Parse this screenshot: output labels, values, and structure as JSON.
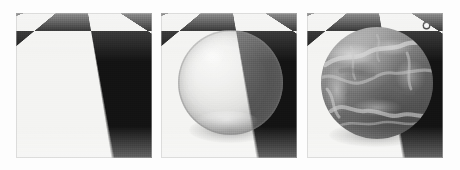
{
  "figure": {
    "background_color": "#fdfdfd",
    "panel_count": 3,
    "panel_width_px": 136,
    "panel_height_px": 145,
    "caption": ""
  },
  "panels": [
    {
      "id": "panel-1",
      "name": "checkerboard-floor",
      "label": "",
      "description": "Black and white checkerboard floor in perspective, no object",
      "x": 16,
      "y": 13,
      "width": 136,
      "height": 145,
      "floor": {
        "light_color": "#f4f4f2",
        "dark_color": "#131313",
        "tile_count_across": 12,
        "horizon_y_fraction": 0.0
      },
      "object": null
    },
    {
      "id": "panel-2",
      "name": "translucent-sphere",
      "label": "",
      "description": "Semi-transparent glass sphere resting on the checkerboard floor, checker pattern visible through it with reduced contrast",
      "x": 161,
      "y": 13,
      "width": 136,
      "height": 145,
      "floor": {
        "light_color": "#f4f4f2",
        "dark_color": "#131313",
        "tile_count_across": 12,
        "horizon_y_fraction": 0.0
      },
      "object": {
        "type": "sphere",
        "material": "translucent-glass",
        "center_x": 70,
        "center_y": 70,
        "radius": 53,
        "opacity": 0.45,
        "tint_color": "#9a9a9a",
        "highlight_color": "#ffffff"
      }
    },
    {
      "id": "panel-3",
      "name": "opaque-marble-sphere",
      "label": "",
      "description": "Opaque marble / stone textured sphere occluding the checkerboard floor, with lighter veining",
      "x": 307,
      "y": 13,
      "width": 136,
      "height": 145,
      "floor": {
        "light_color": "#f4f4f2",
        "dark_color": "#131313",
        "tile_count_across": 12,
        "horizon_y_fraction": 0.0
      },
      "object": {
        "type": "sphere",
        "material": "opaque-marble",
        "center_x": 70,
        "center_y": 70,
        "radius": 56,
        "opacity": 1.0,
        "base_color": "#878787",
        "vein_color": "#d2d2d2",
        "shadow_color": "#4a4a4a"
      },
      "marker": {
        "name": "specular-highlight-marker",
        "x": 119,
        "y": 12,
        "color": "#f6f6f6",
        "outline_color": "#1d1d1d"
      }
    }
  ]
}
